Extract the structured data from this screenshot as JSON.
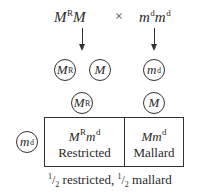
{
  "cross": {
    "parent1": {
      "base1": "M",
      "sup1": "R",
      "base2": "M",
      "sup2": ""
    },
    "operator": "×",
    "parent2": {
      "base1": "m",
      "sup1": "d",
      "base2": "m",
      "sup2": "d"
    }
  },
  "gametes_parent1": [
    {
      "base": "M",
      "sup": "R"
    },
    {
      "base": "M",
      "sup": ""
    }
  ],
  "gametes_parent2": [
    {
      "base": "m",
      "sup": "d"
    }
  ],
  "punnett": {
    "column_headers": [
      {
        "base": "M",
        "sup": "R"
      },
      {
        "base": "M",
        "sup": ""
      }
    ],
    "row_headers": [
      {
        "base": "m",
        "sup": "d"
      }
    ],
    "cells": [
      {
        "genotype_a": "M",
        "genotype_a_sup": "R",
        "genotype_b": "m",
        "genotype_b_sup": "d",
        "phenotype": "Restricted"
      },
      {
        "genotype_a": "M",
        "genotype_a_sup": "",
        "genotype_b": "m",
        "genotype_b_sup": "d",
        "phenotype": "Mallard"
      }
    ]
  },
  "result": {
    "frac_num": "1",
    "frac_den": "2",
    "label1": "restricted,",
    "label2": "mallard"
  }
}
